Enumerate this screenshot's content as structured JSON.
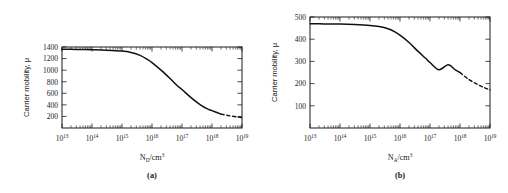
{
  "figure": {
    "background": "#ffffff",
    "ink_color": "#111111"
  },
  "chart_data": [
    {
      "type": "line",
      "panel_label": "(a)",
      "title": "",
      "xlabel": "N_D/cm3",
      "xlabel_base": "N",
      "xlabel_sub": "D",
      "xlabel_rest": "/cm",
      "xlabel_sup": "3",
      "ylabel": "Carrier mobility, μ",
      "xscale": "log",
      "yscale": "linear",
      "xlim": [
        10000000000000.0,
        1e+19
      ],
      "ylim": [
        0,
        1400
      ],
      "xticks": [
        10000000000000.0,
        100000000000000.0,
        1000000000000000.0,
        1e+16,
        1e+17,
        1e+18,
        1e+19
      ],
      "xtick_labels": [
        "10^13",
        "10^14",
        "10^15",
        "10^16",
        "10^17",
        "10^18",
        "10^19"
      ],
      "xtick_exponents": [
        "13",
        "14",
        "15",
        "16",
        "17",
        "18",
        "19"
      ],
      "yticks": [
        200,
        400,
        600,
        800,
        1000,
        1200,
        1400
      ],
      "ytick_labels": [
        "200",
        "400",
        "600",
        "800",
        "1000",
        "1200",
        "1400"
      ],
      "grid": false,
      "legend": "none",
      "series": [
        {
          "name": "electron mobility vs donor concentration",
          "style": "solid",
          "x": [
            10000000000000.0,
            30000000000000.0,
            100000000000000.0,
            300000000000000.0,
            1000000000000000.0,
            2000000000000000.0,
            4000000000000000.0,
            7000000000000000.0,
            1e+16,
            2e+16,
            4e+16,
            7e+16,
            1e+17,
            2e+17,
            4e+17,
            7e+17,
            1e+18,
            2e+18
          ],
          "y": [
            1360,
            1358,
            1352,
            1345,
            1330,
            1305,
            1255,
            1185,
            1130,
            1000,
            855,
            730,
            665,
            525,
            405,
            330,
            300,
            240
          ]
        },
        {
          "name": "extrapolated high-concentration tail",
          "style": "dashed",
          "x": [
            2e+18,
            4e+18,
            7e+18,
            1e+19
          ],
          "y": [
            240,
            210,
            190,
            178
          ]
        }
      ]
    },
    {
      "type": "line",
      "panel_label": "(b)",
      "title": "",
      "xlabel": "N_A/cm3",
      "xlabel_base": "N",
      "xlabel_sub": "A",
      "xlabel_rest": "/cm",
      "xlabel_sup": "3",
      "ylabel": "Carrier mobility, μ",
      "xscale": "log",
      "yscale": "linear",
      "xlim": [
        10000000000000.0,
        1e+19
      ],
      "ylim": [
        0,
        500
      ],
      "xticks": [
        10000000000000.0,
        100000000000000.0,
        1000000000000000.0,
        1e+16,
        1e+17,
        1e+18,
        1e+19
      ],
      "xtick_labels": [
        "10^13",
        "10^14",
        "10^15",
        "10^16",
        "10^17",
        "10^18",
        "10^19"
      ],
      "xtick_exponents": [
        "13",
        "14",
        "15",
        "16",
        "17",
        "18",
        "19"
      ],
      "yticks": [
        100,
        200,
        300,
        400,
        500
      ],
      "ytick_labels": [
        "100",
        "200",
        "300",
        "400",
        "500"
      ],
      "grid": false,
      "legend": "none",
      "series": [
        {
          "name": "hole mobility vs acceptor concentration",
          "style": "solid",
          "x": [
            10000000000000.0,
            30000000000000.0,
            100000000000000.0,
            300000000000000.0,
            1000000000000000.0,
            2000000000000000.0,
            4000000000000000.0,
            7000000000000000.0,
            1e+16,
            2e+16,
            4e+16,
            7e+16,
            1e+17,
            2e+17,
            4e+17,
            7e+17,
            1e+18
          ],
          "y": [
            470,
            469,
            468,
            466,
            462,
            457,
            447,
            432,
            418,
            385,
            345,
            315,
            295,
            262,
            285,
            262,
            250
          ]
        },
        {
          "name": "extrapolated high-concentration tail",
          "style": "dashed",
          "x": [
            1e+18,
            2e+18,
            4e+18,
            7e+18,
            1e+19
          ],
          "y": [
            250,
            218,
            195,
            180,
            172
          ]
        }
      ]
    }
  ]
}
